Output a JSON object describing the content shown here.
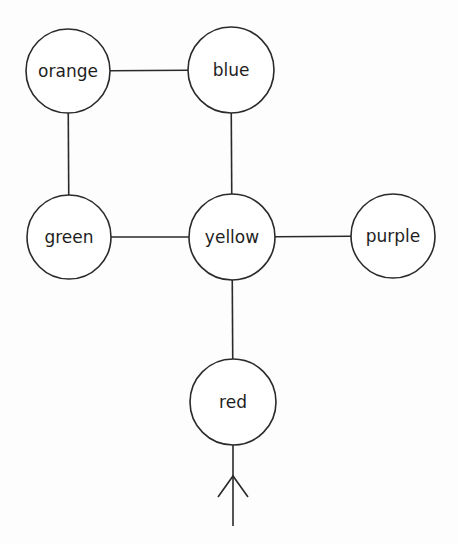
{
  "diagram": {
    "type": "graph",
    "nodes": [
      {
        "id": "orange",
        "label": "orange",
        "cx": 68,
        "cy": 71,
        "r": 42
      },
      {
        "id": "blue",
        "label": "blue",
        "cx": 231,
        "cy": 70,
        "r": 43
      },
      {
        "id": "green",
        "label": "green",
        "cx": 69,
        "cy": 237,
        "r": 42
      },
      {
        "id": "yellow",
        "label": "yellow",
        "cx": 232,
        "cy": 237,
        "r": 43
      },
      {
        "id": "purple",
        "label": "purple",
        "cx": 393,
        "cy": 236,
        "r": 42
      },
      {
        "id": "red",
        "label": "red",
        "cx": 233,
        "cy": 402,
        "r": 43
      }
    ],
    "edges": [
      {
        "from": "orange",
        "to": "blue"
      },
      {
        "from": "orange",
        "to": "green"
      },
      {
        "from": "blue",
        "to": "yellow"
      },
      {
        "from": "green",
        "to": "yellow"
      },
      {
        "from": "yellow",
        "to": "purple"
      },
      {
        "from": "yellow",
        "to": "red"
      }
    ],
    "entry_arrow": {
      "target": "red",
      "x": 233,
      "y_start": 526,
      "tip_y": 476,
      "arm_dx": 15,
      "arm_dy": 21,
      "direction": "up"
    }
  }
}
